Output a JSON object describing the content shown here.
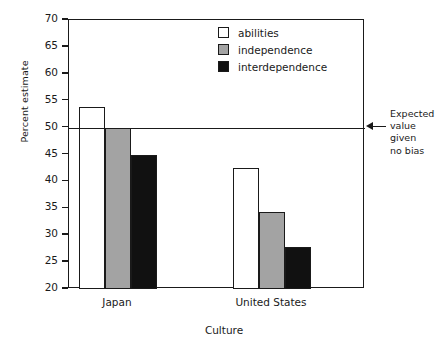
{
  "chart_data": {
    "type": "bar",
    "title": "",
    "xlabel": "Culture",
    "ylabel": "Percent estimate",
    "categories": [
      "Japan",
      "United States"
    ],
    "series": [
      {
        "name": "abilities",
        "color": "#ffffff",
        "swatch": "swatch-white",
        "values": [
          53.8,
          42.4
        ]
      },
      {
        "name": "independence",
        "color": "#a3a3a3",
        "swatch": "swatch-gray",
        "values": [
          50.0,
          34.3
        ]
      },
      {
        "name": "interdependence",
        "color": "#111111",
        "swatch": "swatch-black",
        "values": [
          45.0,
          27.8
        ]
      }
    ],
    "ylim": [
      20,
      70
    ],
    "yticks": [
      20,
      25,
      30,
      35,
      40,
      45,
      50,
      55,
      60,
      65,
      70
    ],
    "ytick_labels": [
      "20",
      "25",
      "30",
      "35",
      "40",
      "45",
      "50",
      "55",
      "60",
      "65",
      "70"
    ],
    "grid": false,
    "legend_position": "top-center",
    "reference_line": {
      "value": 50,
      "annotation": [
        "Expected",
        "value",
        "given",
        "no bias"
      ],
      "arrow": "left-arrow-icon"
    }
  },
  "axis": {
    "ylabel": "Percent estimate",
    "xlabel": "Culture"
  }
}
